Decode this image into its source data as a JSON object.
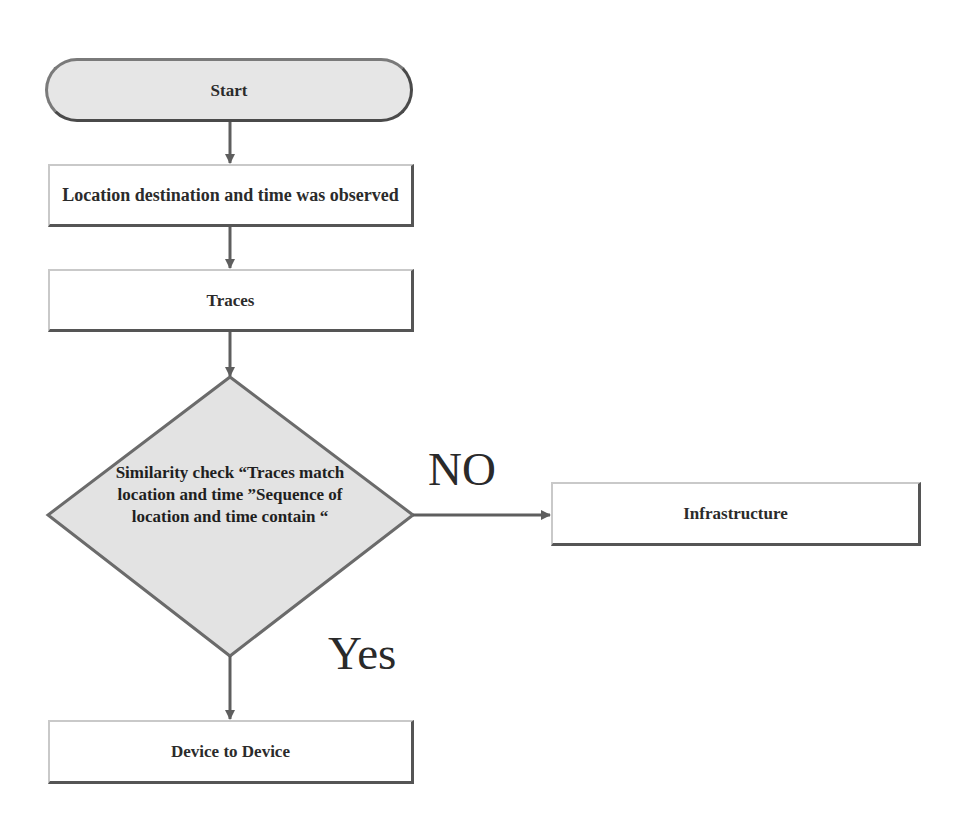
{
  "diagram": {
    "type": "flowchart",
    "nodes": {
      "start": {
        "label": "Start",
        "shape": "terminator"
      },
      "location": {
        "label": "Location destination and time was observed",
        "shape": "process"
      },
      "traces": {
        "label": "Traces",
        "shape": "process"
      },
      "decision": {
        "label": "Similarity check “Traces match location and time ”Sequence of location and time contain “",
        "shape": "decision"
      },
      "infrastructure": {
        "label": "Infrastructure",
        "shape": "process"
      },
      "device": {
        "label": "Device to Device",
        "shape": "process"
      }
    },
    "edges": [
      {
        "from": "start",
        "to": "location",
        "label": ""
      },
      {
        "from": "location",
        "to": "traces",
        "label": ""
      },
      {
        "from": "traces",
        "to": "decision",
        "label": ""
      },
      {
        "from": "decision",
        "to": "infrastructure",
        "label": "NO"
      },
      {
        "from": "decision",
        "to": "device",
        "label": "Yes"
      }
    ],
    "edge_labels": {
      "no": "NO",
      "yes": "Yes"
    },
    "colors": {
      "terminator_fill": "#e6e6e6",
      "decision_fill": "#e3e3e3",
      "stroke": "#6b6b6b",
      "text": "#2b2b2b"
    }
  }
}
